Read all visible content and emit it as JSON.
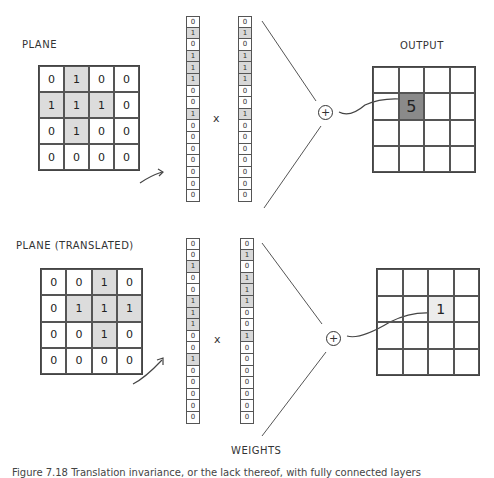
{
  "top": {
    "plane_label": "PLANE",
    "plane": [
      [
        0,
        1,
        0,
        0
      ],
      [
        1,
        1,
        1,
        0
      ],
      [
        0,
        1,
        0,
        0
      ],
      [
        0,
        0,
        0,
        0
      ]
    ],
    "input_vector": [
      0,
      1,
      0,
      1,
      1,
      1,
      0,
      0,
      1,
      0,
      0,
      0,
      0,
      0,
      0,
      0
    ],
    "times": "x",
    "weights_vector": [
      0,
      1,
      0,
      1,
      1,
      1,
      0,
      0,
      1,
      0,
      0,
      0,
      0,
      0,
      0,
      0
    ],
    "sum_symbol": "+",
    "output_label": "OUTPUT",
    "output_value": "5",
    "output_cell": {
      "row": 1,
      "col": 1
    }
  },
  "bottom": {
    "plane_label": "PLANE (TRANSLATED)",
    "plane": [
      [
        0,
        0,
        1,
        0
      ],
      [
        0,
        1,
        1,
        1
      ],
      [
        0,
        0,
        1,
        0
      ],
      [
        0,
        0,
        0,
        0
      ]
    ],
    "input_vector": [
      0,
      0,
      1,
      0,
      0,
      1,
      1,
      1,
      0,
      0,
      1,
      0,
      0,
      0,
      0,
      0
    ],
    "times": "x",
    "weights_vector": [
      0,
      1,
      0,
      1,
      1,
      1,
      0,
      0,
      1,
      0,
      0,
      0,
      0,
      0,
      0,
      0
    ],
    "sum_symbol": "+",
    "output_value": "1",
    "output_cell": {
      "row": 1,
      "col": 2
    }
  },
  "weights_label": "WEIGHTS",
  "caption": "Figure 7.18 Translation invariance, or the lack thereof, with fully connected layers"
}
